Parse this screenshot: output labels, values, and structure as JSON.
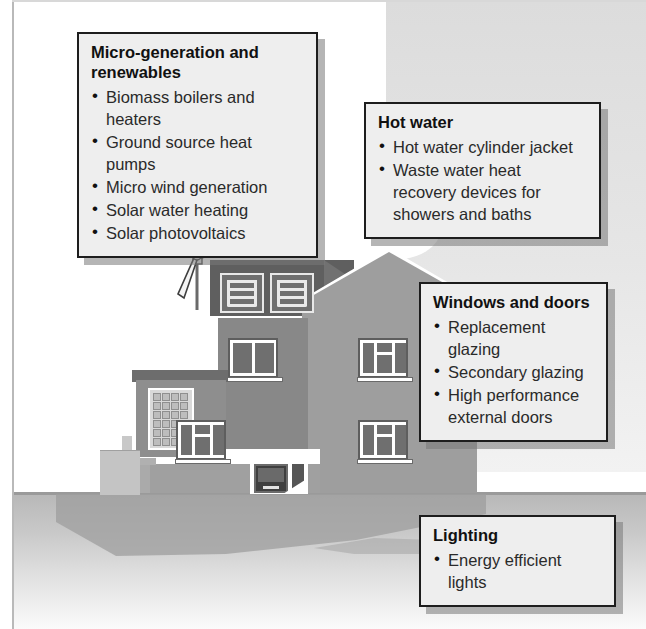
{
  "diagram": {
    "scene": {
      "house_label": "energy-efficient-house-illustration",
      "elements": [
        "wind-turbine",
        "solar-thermal-collectors",
        "solar-photovoltaic-panel",
        "front-door",
        "windows",
        "cloud",
        "ground"
      ]
    },
    "callouts": [
      {
        "id": "micro-generation",
        "title": "Micro-generation and renewables",
        "items": [
          "Biomass boilers and heaters",
          "Ground source heat pumps",
          "Micro wind generation",
          "Solar water heating",
          "Solar photovoltaics"
        ]
      },
      {
        "id": "hot-water",
        "title": "Hot water",
        "items": [
          "Hot water cylinder jacket",
          "Waste water heat recovery devices for showers and baths"
        ]
      },
      {
        "id": "windows-and-doors",
        "title": "Windows and doors",
        "items": [
          "Replacement glazing",
          "Secondary glazing",
          "High performance external doors"
        ]
      },
      {
        "id": "lighting",
        "title": "Lighting",
        "items": [
          "Energy efficient lights"
        ]
      }
    ],
    "colors": {
      "callout_fill": "#eeeeee",
      "callout_border": "#1d1d1d",
      "wall": "#9e9e9e",
      "roof": "#5f5f5f",
      "ground": "#b7b7b7",
      "sky": "#ffffff"
    }
  }
}
